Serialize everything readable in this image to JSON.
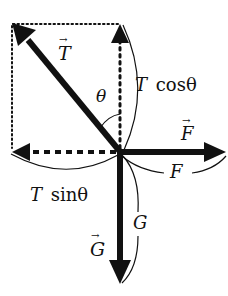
{
  "diagram": {
    "labels": {
      "tension_vector": "T",
      "angle": "θ",
      "t_cos": "T cosθ",
      "t_cos_T": "T",
      "t_cos_fn": "cosθ",
      "t_sin_T": "T",
      "t_sin_fn": "sinθ",
      "force_vector": "F",
      "force_magnitude": "F",
      "gravity_vector": "G",
      "gravity_magnitude": "G"
    },
    "colors": {
      "ink": "#111111",
      "background": "#ffffff"
    },
    "geometry": {
      "origin": [
        120,
        152
      ],
      "tension_tip": [
        12,
        24
      ],
      "vertical_component_tip": [
        120,
        24
      ],
      "horizontal_component_tip": [
        12,
        152
      ],
      "force_tip": [
        224,
        152
      ],
      "gravity_tip": [
        120,
        284
      ]
    }
  }
}
